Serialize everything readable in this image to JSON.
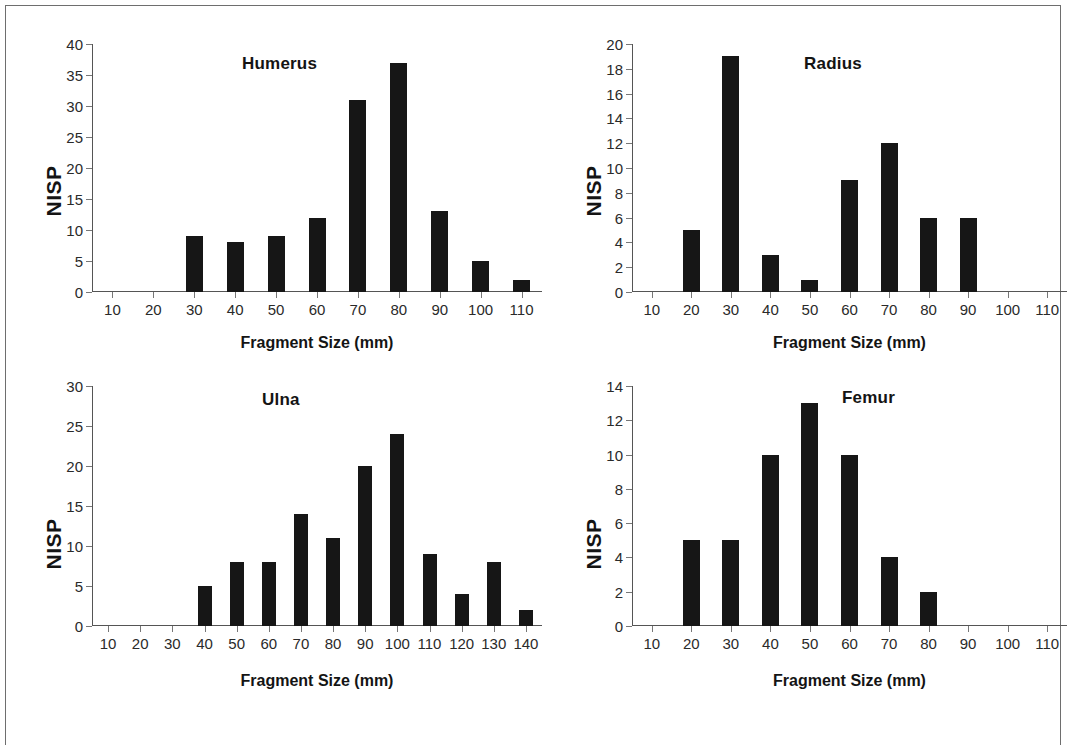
{
  "figure": {
    "y_axis_title": "NISP",
    "x_axis_title": "Fragment Size (mm)",
    "bar_color": "#161616",
    "axis_color": "#555555",
    "frame_color": "#6e6e6e"
  },
  "chart_data": [
    {
      "type": "bar",
      "title": "Humerus",
      "xlabel": "Fragment Size (mm)",
      "ylabel": "NISP",
      "categories": [
        10,
        20,
        30,
        40,
        50,
        60,
        70,
        80,
        90,
        100,
        110
      ],
      "values": [
        0,
        0,
        9,
        8,
        9,
        12,
        31,
        37,
        13,
        5,
        2
      ],
      "ylim": [
        0,
        40
      ],
      "ytick_step": 5,
      "yticks": [
        0,
        5,
        10,
        15,
        20,
        25,
        30,
        35,
        40
      ],
      "grid": false,
      "legend": null
    },
    {
      "type": "bar",
      "title": "Radius",
      "xlabel": "Fragment Size (mm)",
      "ylabel": "NISP",
      "categories": [
        10,
        20,
        30,
        40,
        50,
        60,
        70,
        80,
        90,
        100,
        110
      ],
      "values": [
        0,
        5,
        19,
        3,
        1,
        9,
        12,
        6,
        6,
        0,
        0
      ],
      "ylim": [
        0,
        20
      ],
      "ytick_step": 2,
      "yticks": [
        0,
        2,
        4,
        6,
        8,
        10,
        12,
        14,
        16,
        18,
        20
      ],
      "grid": false,
      "legend": null
    },
    {
      "type": "bar",
      "title": "Ulna",
      "xlabel": "Fragment Size (mm)",
      "ylabel": "NISP",
      "categories": [
        10,
        20,
        30,
        40,
        50,
        60,
        70,
        80,
        90,
        100,
        110,
        120,
        130,
        140
      ],
      "values": [
        0,
        0,
        0,
        5,
        8,
        8,
        14,
        11,
        20,
        24,
        9,
        4,
        8,
        2
      ],
      "ylim": [
        0,
        30
      ],
      "ytick_step": 5,
      "yticks": [
        0,
        5,
        10,
        15,
        20,
        25,
        30
      ],
      "grid": false,
      "legend": null
    },
    {
      "type": "bar",
      "title": "Femur",
      "xlabel": "Fragment Size (mm)",
      "ylabel": "NISP",
      "categories": [
        10,
        20,
        30,
        40,
        50,
        60,
        70,
        80,
        90,
        100,
        110
      ],
      "values": [
        0,
        5,
        5,
        10,
        13,
        10,
        4,
        2,
        0,
        0,
        0
      ],
      "ylim": [
        0,
        14
      ],
      "ytick_step": 2,
      "yticks": [
        0,
        2,
        4,
        6,
        8,
        10,
        12,
        14
      ],
      "grid": false,
      "legend": null
    }
  ]
}
